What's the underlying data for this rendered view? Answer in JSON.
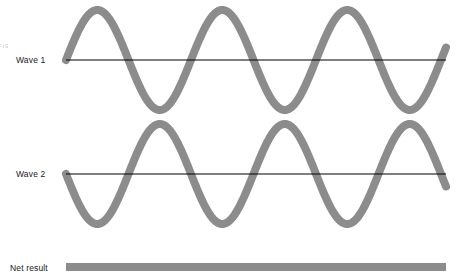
{
  "figure": {
    "background_color": "#ffffff",
    "wave_color": "#8c8c8c",
    "axis_color": "#000000",
    "label_color": "#1a1a1a",
    "edge_caption": "F I G"
  },
  "labels": {
    "wave_1": "Wave 1",
    "wave_2": "Wave 2",
    "net_result": "Net result"
  },
  "chart_data": {
    "type": "line",
    "xlabel": "",
    "ylabel": "",
    "grid": false,
    "legend_position": "left",
    "x_range": [
      66,
      446
    ],
    "series": [
      {
        "name": "Wave 1",
        "waveform": "sine",
        "baseline_y": 60,
        "amplitude_px": 50,
        "period_px": 125,
        "phase_deg": 0,
        "peak_y": 10,
        "trough_y": 110,
        "x_start": 66,
        "x_end": 446,
        "cycles": 3.04,
        "stroke_width": 8,
        "color": "#8c8c8c"
      },
      {
        "name": "Wave 2",
        "waveform": "sine",
        "baseline_y": 174,
        "amplitude_px": 50,
        "period_px": 125,
        "phase_deg": 180,
        "peak_y": 124,
        "trough_y": 224,
        "x_start": 66,
        "x_end": 446,
        "cycles": 3.04,
        "stroke_width": 8,
        "color": "#8c8c8c"
      },
      {
        "name": "Net result",
        "waveform": "flat",
        "baseline_y": 267,
        "amplitude_px": 0,
        "period_px": 0,
        "phase_deg": 0,
        "x_start": 66,
        "x_end": 446,
        "stroke_width": 8,
        "color": "#8c8c8c"
      }
    ],
    "axes": [
      {
        "name": "Wave 1 axis",
        "y": 60,
        "x_start": 66,
        "x_end": 446
      },
      {
        "name": "Wave 2 axis",
        "y": 174,
        "x_start": 66,
        "x_end": 446
      }
    ],
    "annotations": [
      "Wave 1 and Wave 2 are 180 degrees out of phase",
      "Net result is a flat line (complete destructive interference)"
    ]
  }
}
